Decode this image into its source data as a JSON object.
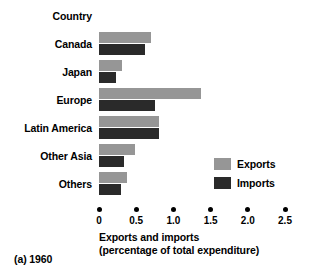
{
  "chart_data": {
    "type": "bar",
    "orientation": "horizontal",
    "title": "",
    "caption": "(a) 1960",
    "header_label": "Country",
    "categories": [
      "Canada",
      "Japan",
      "Europe",
      "Latin America",
      "Other Asia",
      "Others"
    ],
    "series": [
      {
        "name": "Exports",
        "color": "#969696",
        "values": [
          0.7,
          0.31,
          1.37,
          0.8,
          0.49,
          0.38
        ]
      },
      {
        "name": "Imports",
        "color": "#2a2a2a",
        "values": [
          0.62,
          0.23,
          0.75,
          0.8,
          0.34,
          0.3
        ]
      }
    ],
    "xlabel": "Exports and imports",
    "xlabel_line2": "(percentage of total expenditure)",
    "ylabel": "Country",
    "xlim": [
      0,
      2.5
    ],
    "xticks": [
      0,
      0.5,
      1.0,
      1.5,
      2.0,
      2.5
    ],
    "xtick_labels": [
      "0",
      "0.5",
      "1.0",
      "1.5",
      "2.0",
      "2.5"
    ],
    "grid": false,
    "legend": {
      "position": "middle-right",
      "entries": [
        "Exports",
        "Imports"
      ]
    }
  }
}
